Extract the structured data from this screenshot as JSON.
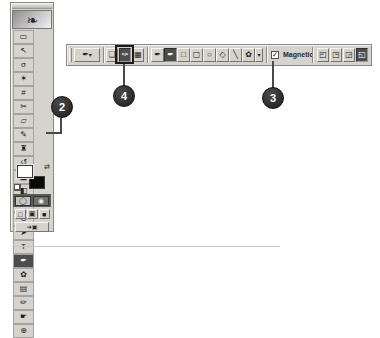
{
  "colors": {
    "chrome": "#d6d3cc",
    "selected_tool_bg": "#4d4d4d",
    "callout_bg": "#2d2d2d",
    "highlight_box": "#1a1a1a"
  },
  "toolbox": {
    "logo_glyph": "❧",
    "tools": [
      {
        "name": "rectangular-marquee",
        "glyph": "▭",
        "selected": false
      },
      {
        "name": "move",
        "glyph": "↖",
        "selected": false
      },
      {
        "name": "lasso",
        "glyph": "σ",
        "selected": false
      },
      {
        "name": "magic-wand",
        "glyph": "✶",
        "selected": false
      },
      {
        "name": "crop",
        "glyph": "#",
        "selected": false
      },
      {
        "name": "slice",
        "glyph": "✂",
        "selected": false
      },
      {
        "name": "healing-brush",
        "glyph": "▱",
        "selected": false
      },
      {
        "name": "brush",
        "glyph": "✎",
        "selected": false
      },
      {
        "name": "clone-stamp",
        "glyph": "♜",
        "selected": false
      },
      {
        "name": "history-brush",
        "glyph": "↺",
        "selected": false
      },
      {
        "name": "eraser",
        "glyph": "◪",
        "selected": false
      },
      {
        "name": "gradient",
        "glyph": "◧",
        "selected": false
      },
      {
        "name": "blur",
        "glyph": "♦",
        "selected": false
      },
      {
        "name": "dodge",
        "glyph": "⊙",
        "selected": false
      },
      {
        "name": "path-selection",
        "glyph": "➤",
        "selected": false
      },
      {
        "name": "type",
        "glyph": "T",
        "selected": false
      },
      {
        "name": "pen",
        "glyph": "✒",
        "selected": true
      },
      {
        "name": "custom-shape",
        "glyph": "✿",
        "selected": false
      },
      {
        "name": "notes",
        "glyph": "▤",
        "selected": false
      },
      {
        "name": "eyedropper",
        "glyph": "✏",
        "selected": false
      },
      {
        "name": "hand",
        "glyph": "☛",
        "selected": false
      },
      {
        "name": "zoom",
        "glyph": "⊕",
        "selected": false
      }
    ],
    "color_swatches": {
      "foreground": "#ffffff",
      "background": "#000000",
      "switch_glyph": "⇄"
    },
    "mode_buttons": [
      {
        "name": "standard-mode",
        "glyph": "◯"
      },
      {
        "name": "quick-mask-mode",
        "glyph": "◉"
      }
    ],
    "screen_buttons": [
      {
        "name": "standard-screen-mode",
        "glyph": "□"
      },
      {
        "name": "full-screen-with-menu",
        "glyph": "▣"
      },
      {
        "name": "full-screen-mode",
        "glyph": "■"
      }
    ],
    "imageready_button": {
      "glyph": "➔▣"
    }
  },
  "options_bar": {
    "tool_preset": {
      "glyph": "✒",
      "dropdown_glyph": "▾"
    },
    "draw_mode_buttons": [
      {
        "name": "shape-layers",
        "glyph": "❏",
        "selected": false
      },
      {
        "name": "paths",
        "glyph": "✑",
        "selected": true,
        "highlighted": true
      },
      {
        "name": "fill-pixels",
        "glyph": "▦",
        "selected": false
      }
    ],
    "shape_tool_buttons": [
      {
        "name": "pen-tool",
        "glyph": "✒",
        "selected": false
      },
      {
        "name": "freeform-pen-tool",
        "glyph": "✒",
        "selected": true
      },
      {
        "name": "rectangle-tool",
        "glyph": "□",
        "selected": false
      },
      {
        "name": "rounded-rectangle-tool",
        "glyph": "▢",
        "selected": false
      },
      {
        "name": "ellipse-tool",
        "glyph": "○",
        "selected": false
      },
      {
        "name": "polygon-tool",
        "glyph": "◇",
        "selected": false
      },
      {
        "name": "line-tool",
        "glyph": "╲",
        "selected": false
      },
      {
        "name": "custom-shape-tool",
        "glyph": "✿",
        "selected": false
      }
    ],
    "shape_dropdown_glyph": "▾",
    "magnetic": {
      "label": "Magnetic",
      "checked": true,
      "check_glyph": "✓"
    },
    "path_area_buttons": [
      {
        "name": "add-to-path-area",
        "glyph": "◰",
        "selected": false
      },
      {
        "name": "subtract-from-path-area",
        "glyph": "◳",
        "selected": false
      },
      {
        "name": "intersect-path-areas",
        "glyph": "◲",
        "selected": false
      },
      {
        "name": "exclude-overlapping-path-areas",
        "glyph": "◱",
        "selected": true
      }
    ]
  },
  "callouts": [
    {
      "number": "2",
      "target": "pen-tool-in-toolbox"
    },
    {
      "number": "3",
      "target": "magnetic-checkbox"
    },
    {
      "number": "4",
      "target": "paths-button"
    }
  ]
}
